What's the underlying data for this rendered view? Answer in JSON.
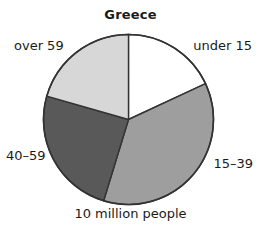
{
  "chart_data": {
    "type": "pie",
    "title": "Greece",
    "caption": "10 million people",
    "total_label": "10 million people",
    "xlabel": "",
    "ylabel": "",
    "legend_position": "outside-labels",
    "grid": false,
    "categories": [
      "under 15",
      "15-39",
      "40-59",
      "over 59"
    ],
    "values": [
      18,
      37,
      25,
      20
    ],
    "slices": [
      {
        "label": "under 15",
        "value": 18,
        "start_angle_deg": 0,
        "end_angle_deg": 65,
        "color": "#ffffff"
      },
      {
        "label": "15-39",
        "value": 37,
        "start_angle_deg": 65,
        "end_angle_deg": 197,
        "color": "#9e9e9e"
      },
      {
        "label": "40-59",
        "value": 25,
        "start_angle_deg": 197,
        "end_angle_deg": 286,
        "color": "#595959"
      },
      {
        "label": "over 59",
        "value": 20,
        "start_angle_deg": 286,
        "end_angle_deg": 360,
        "color": "#d7d7d7"
      }
    ],
    "outline_color": "#333333",
    "labels": {
      "under_15": "under 15",
      "age_15_39": "15–39",
      "age_40_59": "40–59",
      "over_59": "over 59"
    }
  }
}
